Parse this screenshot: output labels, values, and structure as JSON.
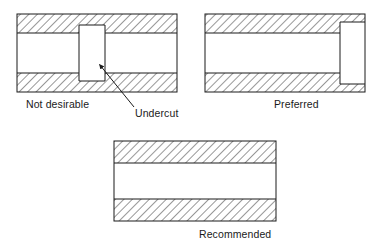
{
  "figure_title": "Undercut design guidance cross-sections",
  "style": {
    "line_color": "#1a1a1a",
    "hatch_color": "#3a3a3a",
    "fill_color": "#ffffff",
    "background": "#ffffff",
    "hatch_angle_deg": 45,
    "line_width_px": 1
  },
  "figures": [
    {
      "id": "not-desirable",
      "caption": "Not desirable",
      "description": "Cross-section of bore with sharp square undercut groove",
      "outline": {
        "x": 17,
        "y": 14,
        "width": 160,
        "height": 78
      },
      "top_band": {
        "x": 17,
        "y": 14,
        "width": 160,
        "height": 19,
        "hatched": true
      },
      "bottom_band": {
        "x": 17,
        "y": 73,
        "width": 160,
        "height": 19,
        "hatched": true
      },
      "bore": {
        "x": 17,
        "y": 33,
        "width": 160,
        "height": 40,
        "hatched": false
      },
      "undercut": {
        "x": 79,
        "y": 25,
        "width": 26,
        "height": 56,
        "hatched": false
      }
    },
    {
      "id": "preferred",
      "caption": "Preferred",
      "description": "Cross-section of bore with relief recess at right end",
      "outline": {
        "x": 205,
        "y": 14,
        "width": 160,
        "height": 78
      },
      "top_band": {
        "x": 205,
        "y": 14,
        "width": 160,
        "height": 19,
        "hatched": true
      },
      "bottom_band": {
        "x": 205,
        "y": 73,
        "width": 160,
        "height": 19,
        "hatched": true
      },
      "bore": {
        "x": 205,
        "y": 33,
        "width": 160,
        "height": 40,
        "hatched": false
      },
      "relief": {
        "x": 340,
        "y": 22,
        "width": 25,
        "height": 62,
        "hatched": false
      }
    },
    {
      "id": "recommended",
      "caption": "Recommended",
      "description": "Plain cross-section of bore with no undercut",
      "outline": {
        "x": 114,
        "y": 141,
        "width": 162,
        "height": 80
      },
      "top_band": {
        "x": 114,
        "y": 141,
        "width": 162,
        "height": 22,
        "hatched": true
      },
      "bottom_band": {
        "x": 114,
        "y": 199,
        "width": 162,
        "height": 22,
        "hatched": true
      },
      "bore": {
        "x": 114,
        "y": 163,
        "width": 162,
        "height": 36,
        "hatched": false
      }
    }
  ],
  "annotations": [
    {
      "id": "undercut-callout",
      "label": "Undercut",
      "leader_line": {
        "x1": 134,
        "y1": 107,
        "x2": 98,
        "y2": 63
      },
      "arrow_tip": {
        "x": 98,
        "y": 63
      },
      "points_to": "undercut"
    }
  ]
}
